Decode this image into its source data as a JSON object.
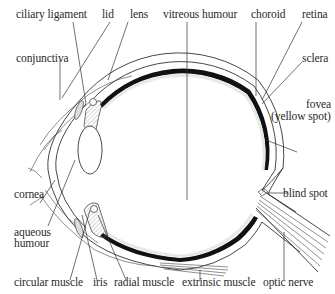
{
  "diagram": {
    "labels": {
      "ciliary_ligament": "ciliary ligament",
      "lid": "lid",
      "lens": "lens",
      "vitreous_humour": "vitreous humour",
      "choroid": "choroid",
      "retina": "retina",
      "conjunctiva": "conjunctiva",
      "sclera": "sclera",
      "fovea_line1": "fovea",
      "fovea_line2": "(yellow spot)",
      "cornea": "cornea",
      "aqueous_line1": "aqueous",
      "aqueous_line2": "humour",
      "blind_spot": "blind spot",
      "circular_muscle": "circular muscle",
      "iris": "iris",
      "radial_muscle": "radial muscle",
      "extrinsic_muscle": "extrinsic muscle",
      "optic_nerve": "optic nerve"
    },
    "colors": {
      "line": "#333333",
      "choroid_fill": "#111111",
      "background": "#ffffff"
    }
  }
}
